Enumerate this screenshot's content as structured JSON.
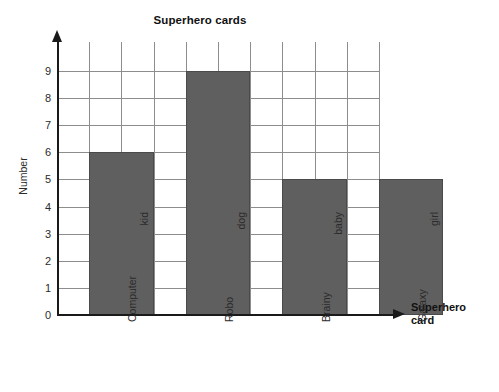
{
  "chart_data": {
    "type": "bar",
    "title": "Superhero cards",
    "xlabel": "Superhero card",
    "ylabel": "Number",
    "categories": [
      "Computer kid",
      "Robo dog",
      "Brainy baby",
      "Galaxy girl"
    ],
    "category_lines": [
      [
        "Computer",
        "kid"
      ],
      [
        "Robo",
        "dog"
      ],
      [
        "Brainy",
        "baby"
      ],
      [
        "Galaxy",
        "girl"
      ]
    ],
    "values": [
      6,
      9,
      5,
      5
    ],
    "ylim": [
      0,
      9
    ],
    "ytick_labels": [
      "0",
      "1",
      "2",
      "3",
      "4",
      "5",
      "6",
      "7",
      "8",
      "9"
    ],
    "grid": true,
    "legend": "none",
    "bar_color": "#5f5f5f",
    "grid_color": "#8d8d8d",
    "axis_color": "#1a1a1a",
    "background": "#ffffff"
  },
  "axis_titles": {
    "x_line1": "Superhero",
    "x_line2": "card"
  }
}
